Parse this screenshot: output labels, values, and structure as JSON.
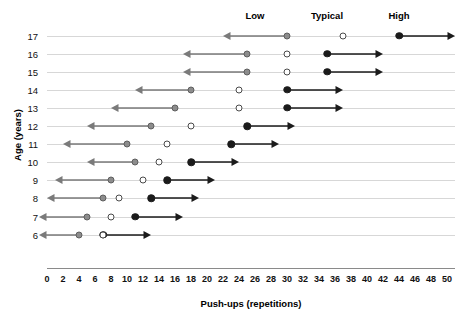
{
  "chart_data": {
    "type": "scatter",
    "title": "",
    "xlabel": "Push-ups (repetitions)",
    "ylabel": "Age (years)",
    "xlim": [
      0,
      50
    ],
    "xticks": [
      0,
      2,
      4,
      6,
      8,
      10,
      12,
      14,
      16,
      18,
      20,
      22,
      24,
      26,
      28,
      30,
      32,
      34,
      36,
      38,
      40,
      42,
      44,
      46,
      48,
      50
    ],
    "categories": [
      17,
      16,
      15,
      14,
      13,
      12,
      11,
      10,
      9,
      8,
      7,
      6
    ],
    "grid": true,
    "legend_position": "top",
    "band_labels": [
      {
        "label": "Low",
        "x": 26
      },
      {
        "label": "Typical",
        "x": 35
      },
      {
        "label": "High",
        "x": 44
      }
    ],
    "series": [
      {
        "name": "Low",
        "marker": "gray-filled-circle",
        "color": "#8c8c8c",
        "direction": "left",
        "values": [
          30,
          25,
          25,
          18,
          16,
          13,
          10,
          11,
          8,
          7,
          5,
          4
        ]
      },
      {
        "name": "Typical",
        "marker": "open-circle",
        "color": "#ffffff",
        "direction": "none",
        "values": [
          37,
          30,
          30,
          24,
          24,
          18,
          15,
          14,
          12,
          9,
          8,
          7
        ]
      },
      {
        "name": "High",
        "marker": "black-filled-circle",
        "color": "#1b1b1b",
        "direction": "right",
        "values": [
          44,
          35,
          35,
          30,
          30,
          25,
          23,
          18,
          15,
          13,
          11,
          7
        ]
      }
    ],
    "arrow_lengths": {
      "low": [
        8,
        8,
        8,
        7,
        8,
        8,
        8,
        6,
        7,
        7,
        6,
        5
      ],
      "high": [
        7,
        7,
        7,
        7,
        7,
        6,
        6,
        6,
        6,
        6,
        6,
        6
      ]
    }
  },
  "axis": {
    "y_title": "Age (years)",
    "x_title": "Push-ups (repetitions)"
  }
}
